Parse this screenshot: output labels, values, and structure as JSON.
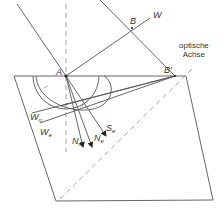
{
  "diagram": {
    "points": {
      "A": {
        "label": "A",
        "x": 66,
        "y": 76
      },
      "B": {
        "label": "B",
        "x": 132,
        "y": 28
      },
      "B_prime": {
        "label": "B'",
        "x": 175,
        "y": 76
      }
    },
    "labels": {
      "A": "A",
      "B": "B",
      "B_prime": "B'",
      "W": "W",
      "W_o_main": "W",
      "W_o_sub": "o",
      "W_e_main": "W",
      "W_e_sub": "e",
      "N_o_main": "N",
      "N_o_sub": "o",
      "N_e_main": "N",
      "N_e_sub": "e",
      "S_e_main": "S",
      "S_e_sub": "e",
      "optic_axis_line1": "optische",
      "optic_axis_line2": "Achse"
    },
    "colors": {
      "line": "#555555",
      "dashed": "#999999",
      "text": "#333333"
    }
  }
}
